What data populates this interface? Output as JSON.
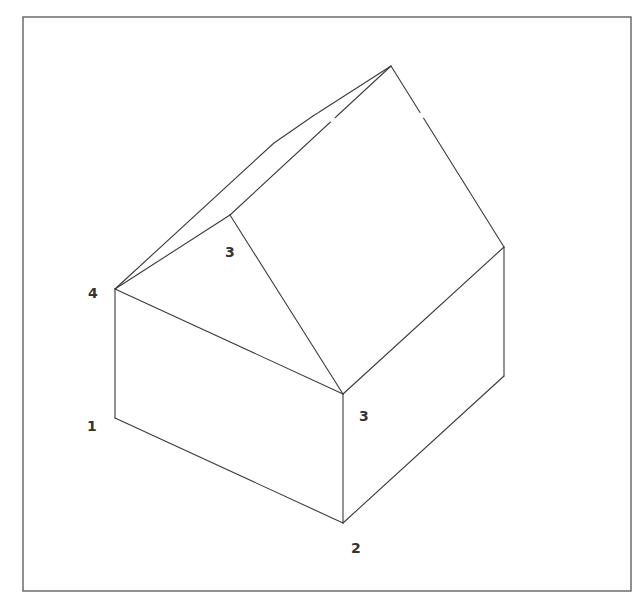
{
  "figure": {
    "frame": {
      "x1": 23,
      "y1": 17,
      "x2": 631,
      "y2": 591
    },
    "colors": {
      "line": "#3a3a3a",
      "frame": "#555555",
      "label": "#333333",
      "background": "#ffffff"
    },
    "vertices": {
      "peak": [
        391,
        66
      ],
      "outer_roof_bend_1": [
        274,
        143
      ],
      "outer_roof_bend_2": [
        313,
        116
      ],
      "gable_apex": [
        230,
        215
      ],
      "left_top": [
        115,
        289
      ],
      "left_bottom": [
        115,
        418
      ],
      "front_top": [
        343,
        394
      ],
      "front_bottom": [
        343,
        523
      ],
      "right_top": [
        504,
        247
      ],
      "right_bottom": [
        504,
        376
      ]
    },
    "labels": [
      {
        "id": "label-4",
        "text": "4",
        "x": 88,
        "y": 298
      },
      {
        "id": "label-1",
        "text": "1",
        "x": 87,
        "y": 431
      },
      {
        "id": "label-3-roof",
        "text": "3",
        "x": 225,
        "y": 257
      },
      {
        "id": "label-3-front",
        "text": "3",
        "x": 359,
        "y": 421
      },
      {
        "id": "label-2",
        "text": "2",
        "x": 351,
        "y": 553
      }
    ]
  }
}
